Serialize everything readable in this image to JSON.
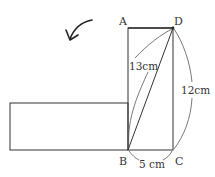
{
  "diagram": {
    "points": {
      "A": {
        "label": "A",
        "x": 128,
        "y": 28
      },
      "D": {
        "label": "D",
        "x": 173,
        "y": 28
      },
      "B": {
        "label": "B",
        "x": 128,
        "y": 150
      },
      "C": {
        "label": "C",
        "x": 173,
        "y": 150
      }
    },
    "measurements": {
      "diagonal_BD": "13cm",
      "side_DC": "12cm",
      "side_BC": "5 cm"
    },
    "rotated_rectangle": {
      "x": 10,
      "y": 103,
      "width": 118,
      "height": 47
    },
    "arrow": {
      "direction": "counterclockwise-rotation",
      "icon": "curved-arrow-icon"
    },
    "colors": {
      "stroke": "#333333",
      "background": "#ffffff"
    }
  }
}
